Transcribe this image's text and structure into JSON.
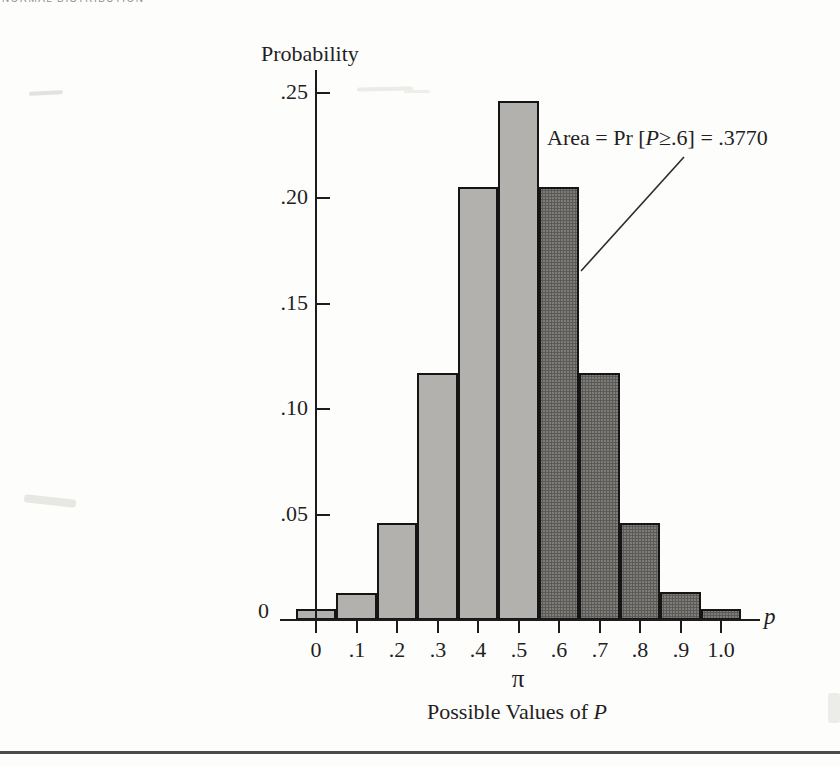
{
  "page": {
    "running_header": "NORMAL DISTRIBUTION"
  },
  "figure": {
    "y_axis_title": "Probability",
    "x_axis_end_label": "p",
    "x_axis_symbol": "π",
    "caption_prefix": "Possible Values of ",
    "caption_italic": "P",
    "annotation": {
      "prefix": "Area = Pr [",
      "variable": "P",
      "operator": "≥",
      "suffix": ".6] = .3770"
    }
  },
  "chart_data": {
    "type": "bar",
    "ylabel": "Probability",
    "xlabel": "π (Possible Values of P)",
    "categories": [
      "0",
      ".1",
      ".2",
      ".3",
      ".4",
      ".5",
      ".6",
      ".7",
      ".8",
      ".9",
      "1.0"
    ],
    "x_values": [
      0,
      0.1,
      0.2,
      0.3,
      0.4,
      0.5,
      0.6,
      0.7,
      0.8,
      0.9,
      1.0
    ],
    "values": [
      0.001,
      0.01,
      0.044,
      0.117,
      0.205,
      0.246,
      0.205,
      0.117,
      0.044,
      0.01,
      0.001
    ],
    "bar_heights_px": [
      11,
      27,
      97,
      247,
      433,
      519,
      433,
      247,
      97,
      28,
      11
    ],
    "highlight_from_x": 0.6,
    "highlight_area_label": "Area = Pr [P ≥ .6] = .3770",
    "highlight_area_value": 0.377,
    "y_ticks": [
      0,
      0.05,
      0.1,
      0.15,
      0.2,
      0.25
    ],
    "y_tick_labels": [
      "0",
      ".05",
      ".10",
      ".15",
      ".20",
      ".25"
    ],
    "ylim": [
      0,
      0.26
    ],
    "grid": false,
    "legend": false,
    "colors": {
      "bar_light": "#b3b1ae",
      "bar_dark": "#7e7c78",
      "bar_border": "#151515",
      "axis": "#1c1c1c"
    }
  }
}
